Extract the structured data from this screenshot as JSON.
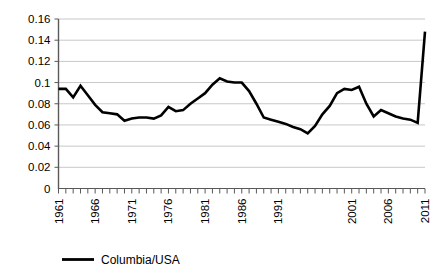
{
  "chart_data": {
    "type": "line",
    "title": "",
    "subtitle": "",
    "xlabel": "",
    "ylabel": "",
    "xlim": [
      1961,
      2011
    ],
    "ylim": [
      0,
      0.16
    ],
    "grid": "horizontal",
    "legend_position": "bottom",
    "y_ticks": [
      "0",
      "0.02",
      "0.04",
      "0.06",
      "0.08",
      "0.1",
      "0.12",
      "0.14",
      "0.16"
    ],
    "y_tick_values": [
      0,
      0.02,
      0.04,
      0.06,
      0.08,
      0.1,
      0.12,
      0.14,
      0.16
    ],
    "x_tick_labels": [
      "1961",
      "1966",
      "1971",
      "1976",
      "1981",
      "1986",
      "1991",
      "2001",
      "2006",
      "2011"
    ],
    "x_tick_years": [
      1961,
      1966,
      1971,
      1976,
      1981,
      1986,
      1991,
      2001,
      2006,
      2011
    ],
    "x_minor_tick_count": 51,
    "series": [
      {
        "name": "Columbia/USA",
        "color": "#000000",
        "x": [
          1961,
          1962,
          1963,
          1964,
          1965,
          1966,
          1967,
          1968,
          1969,
          1970,
          1971,
          1972,
          1973,
          1974,
          1975,
          1976,
          1977,
          1978,
          1979,
          1980,
          1981,
          1982,
          1983,
          1984,
          1985,
          1986,
          1987,
          1988,
          1989,
          1990,
          1991,
          1992,
          1993,
          1994,
          1995,
          1996,
          1997,
          1998,
          1999,
          2000,
          2001,
          2002,
          2003,
          2004,
          2005,
          2006,
          2007,
          2008,
          2009,
          2010,
          2011
        ],
        "values": [
          0.094,
          0.094,
          0.086,
          0.097,
          0.088,
          0.079,
          0.072,
          0.071,
          0.07,
          0.064,
          0.066,
          0.067,
          0.067,
          0.066,
          0.069,
          0.077,
          0.073,
          0.074,
          0.08,
          0.085,
          0.09,
          0.098,
          0.104,
          0.101,
          0.1,
          0.1,
          0.092,
          0.08,
          0.067,
          0.065,
          0.063,
          0.061,
          0.058,
          0.056,
          0.052,
          0.059,
          0.07,
          0.078,
          0.09,
          0.094,
          0.093,
          0.096,
          0.08,
          0.068,
          0.074,
          0.071,
          0.068,
          0.066,
          0.065,
          0.062,
          0.148
        ],
        "values_note": "line trace read from pixels"
      }
    ]
  },
  "legend": {
    "items": [
      {
        "label": "Columbia/USA",
        "color": "#000000",
        "marker": "line-marker"
      }
    ]
  },
  "colors": {
    "series": "#000000",
    "gridline": "#c8c8c8",
    "axis": "#595959",
    "background": "#ffffff",
    "text": "#000000"
  }
}
